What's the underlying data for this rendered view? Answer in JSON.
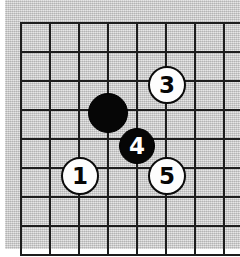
{
  "diagram": {
    "kind": "go-board-diagram",
    "board": {
      "background_color": "#c9c9c9",
      "line_color": "#1d1d1d",
      "page_color": "#ffffff",
      "columns": 8,
      "rows": 8,
      "line_spacing_px": 29,
      "origin_x_px": 20,
      "origin_y_px": 22
    },
    "stones": [
      {
        "move_number": "",
        "color": "black",
        "label": "",
        "has_label": false,
        "x_px": 107,
        "y_px": 112,
        "radius_px": 19,
        "grid_col": 3,
        "grid_row": 3
      },
      {
        "move_number": "1",
        "color": "white",
        "label": "1",
        "has_label": true,
        "x_px": 78,
        "y_px": 174,
        "radius_px": 17,
        "grid_col": 2,
        "grid_row": 5
      },
      {
        "move_number": "3",
        "color": "white",
        "label": "3",
        "has_label": true,
        "x_px": 165,
        "y_px": 83,
        "radius_px": 17,
        "grid_col": 5,
        "grid_row": 2
      },
      {
        "move_number": "4",
        "color": "black",
        "label": "4",
        "has_label": true,
        "x_px": 136,
        "y_px": 145,
        "radius_px": 17,
        "grid_col": 4,
        "grid_row": 4
      },
      {
        "move_number": "5",
        "color": "white",
        "label": "5",
        "has_label": true,
        "x_px": 165,
        "y_px": 174,
        "radius_px": 17,
        "grid_col": 5,
        "grid_row": 5
      }
    ]
  }
}
